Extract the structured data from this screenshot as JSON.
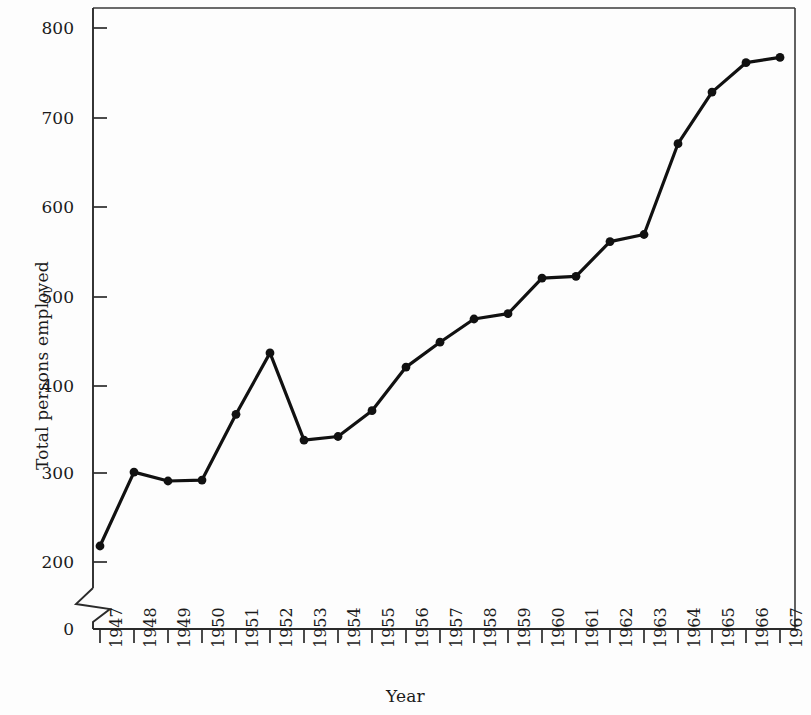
{
  "chart_data": {
    "type": "line",
    "title": "",
    "xlabel": "Year",
    "ylabel": "Total persons employed",
    "categories": [
      "1947",
      "1948",
      "1949",
      "1950",
      "1951",
      "1952",
      "1953",
      "1954",
      "1955",
      "1956",
      "1957",
      "1958",
      "1959",
      "1960",
      "1961",
      "1962",
      "1963",
      "1964",
      "1965",
      "1966",
      "1967"
    ],
    "x": [
      1947,
      1948,
      1949,
      1950,
      1951,
      1952,
      1953,
      1954,
      1955,
      1956,
      1957,
      1958,
      1959,
      1960,
      1961,
      1962,
      1963,
      1964,
      1965,
      1966,
      1967
    ],
    "values": [
      218,
      301,
      291,
      292,
      366,
      435,
      337,
      341,
      370,
      419,
      447,
      473,
      479,
      519,
      521,
      560,
      568,
      670,
      728,
      761,
      767
    ],
    "series": [
      {
        "name": "Total persons employed",
        "values": [
          218,
          301,
          291,
          292,
          366,
          435,
          337,
          341,
          370,
          419,
          447,
          473,
          479,
          519,
          521,
          560,
          568,
          670,
          728,
          761,
          767
        ]
      }
    ],
    "ylim": [
      0,
      830
    ],
    "yticks": [
      0,
      200,
      300,
      400,
      500,
      600,
      700,
      800
    ],
    "ytick_labels": [
      "0",
      "200",
      "300",
      "400",
      "500",
      "600",
      "700",
      "800"
    ],
    "xtick_labels": [
      "1947",
      "1948",
      "1949",
      "1950",
      "1951",
      "1952",
      "1953",
      "1954",
      "1955",
      "1956",
      "1957",
      "1958",
      "1959",
      "1960",
      "1961",
      "1962",
      "1963",
      "1964",
      "1965",
      "1966",
      "1967"
    ],
    "axis_break": {
      "present": true,
      "between": [
        0,
        200
      ],
      "style": "zigzag"
    },
    "grid": false,
    "legend": false,
    "legend_position": "none",
    "marker": "filled-circle",
    "line_color": "#111111",
    "marker_color": "#111111",
    "background_color": "#fdfdfd",
    "frame": "box"
  }
}
